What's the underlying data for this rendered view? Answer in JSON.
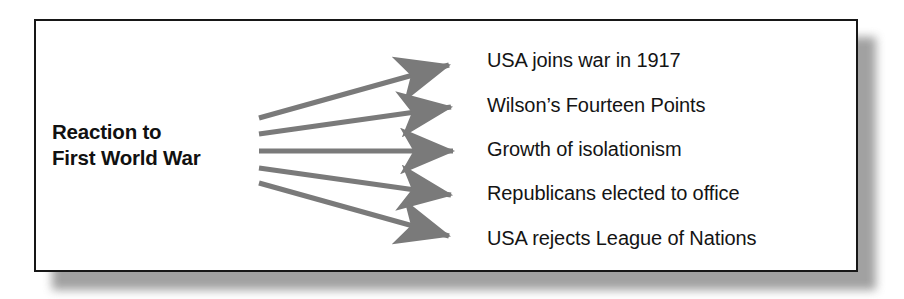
{
  "diagram": {
    "type": "concept-fan-diagram",
    "title_present": false,
    "source": {
      "label_line1": "Reaction to",
      "label_line2": "First World War"
    },
    "outcomes": [
      {
        "id": "usa-joins-war",
        "label": "USA joins war in 1917"
      },
      {
        "id": "fourteen-points",
        "label": "Wilson’s Fourteen Points"
      },
      {
        "id": "isolationism",
        "label": "Growth of isolationism"
      },
      {
        "id": "republicans-elected",
        "label": "Republicans elected to office"
      },
      {
        "id": "league-rejected",
        "label": "USA rejects League of Nations"
      }
    ],
    "connectors": [
      {
        "id": "arrow-1",
        "from": "source",
        "to": "usa-joins-war",
        "direction": "up"
      },
      {
        "id": "arrow-2",
        "from": "source",
        "to": "fourteen-points",
        "direction": "up"
      },
      {
        "id": "arrow-3",
        "from": "source",
        "to": "isolationism",
        "direction": "level"
      },
      {
        "id": "arrow-4",
        "from": "source",
        "to": "republicans-elected",
        "direction": "down"
      },
      {
        "id": "arrow-5",
        "from": "source",
        "to": "league-rejected",
        "direction": "down"
      }
    ],
    "colors": {
      "background": "#ffffff",
      "frame_border": "#171717",
      "frame_shadow": "#7d7d7d",
      "text": "#141414",
      "source_text": "#111111",
      "arrow": "#7a7a7a"
    }
  }
}
